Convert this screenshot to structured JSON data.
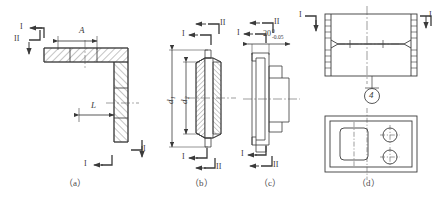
{
  "figure": {
    "type": "engineering-drawing",
    "line_color": "#3a3a3a",
    "hatch_color": "#555555",
    "center_line_color": "#5a5a5a",
    "background": "#ffffff"
  },
  "captions": [
    {
      "id": "a",
      "text": "（a）"
    },
    {
      "id": "b",
      "text": "（b）"
    },
    {
      "id": "c",
      "text": "（c）"
    },
    {
      "id": "d",
      "text": "（d）"
    }
  ],
  "panel_a": {
    "caption": "（a）",
    "dimensions": [
      {
        "name": "A",
        "label": "A"
      },
      {
        "name": "L",
        "label": "L"
      }
    ],
    "section_marks": [
      {
        "id": "a-tl-1",
        "label": "I"
      },
      {
        "id": "a-l-2",
        "label": "II"
      },
      {
        "id": "a-br-1",
        "label": "I"
      },
      {
        "id": "a-b-1",
        "label": "I"
      }
    ]
  },
  "panel_b": {
    "caption": "（b）",
    "dimensions": [
      {
        "name": "d1",
        "label": "d₁"
      },
      {
        "name": "d2",
        "label": "d₂"
      }
    ],
    "section_marks": [
      {
        "id": "b-t-2",
        "label": "II"
      },
      {
        "id": "b-t-1",
        "label": "I"
      },
      {
        "id": "b-b-1",
        "label": "I"
      },
      {
        "id": "b-b-2",
        "label": "II"
      }
    ]
  },
  "panel_c": {
    "caption": "（c）",
    "tolerance": {
      "nominal": "20",
      "upper": "0",
      "lower": "-0.05"
    },
    "section_marks": [
      {
        "id": "c-t-2",
        "label": "II"
      },
      {
        "id": "c-t-1",
        "label": "I"
      },
      {
        "id": "c-b-1",
        "label": "I"
      },
      {
        "id": "c-b-2",
        "label": "II"
      }
    ]
  },
  "panel_d": {
    "caption": "（d）",
    "balloon": "4",
    "section_marks": [
      {
        "id": "d-tl-1",
        "label": "I"
      },
      {
        "id": "d-tr-1",
        "label": "I"
      }
    ]
  }
}
